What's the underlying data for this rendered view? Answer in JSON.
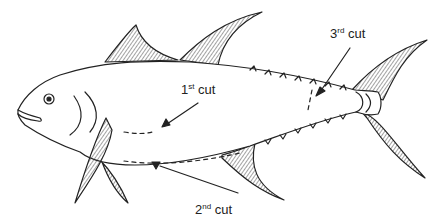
{
  "diagram": {
    "labels": [
      {
        "id": "first-cut",
        "ordinal": "1",
        "suffix": "st",
        "text": "cut"
      },
      {
        "id": "second-cut",
        "ordinal": "2",
        "suffix": "nd",
        "text": "cut"
      },
      {
        "id": "third-cut",
        "ordinal": "3",
        "suffix": "rd",
        "text": "cut"
      }
    ]
  }
}
